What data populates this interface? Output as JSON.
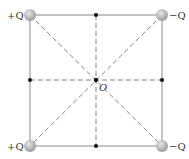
{
  "diagram": {
    "center_label": "O",
    "charges": [
      {
        "position": "top-left",
        "label": "+Q",
        "cx": 30,
        "cy": 15
      },
      {
        "position": "top-right",
        "label": "−Q",
        "cx": 162,
        "cy": 15
      },
      {
        "position": "bottom-left",
        "label": "+Q",
        "cx": 30,
        "cy": 146
      },
      {
        "position": "bottom-right",
        "label": "−Q",
        "cx": 162,
        "cy": 146
      }
    ],
    "midpoints": [
      "top",
      "bottom",
      "left",
      "right"
    ],
    "colors": {
      "square_edge": "#8a8a8a",
      "dashed_line": "#777777",
      "charge_fill": "#b8b8b8",
      "dot": "#111111"
    }
  }
}
